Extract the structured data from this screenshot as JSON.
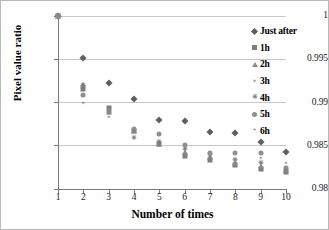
{
  "chart_data": {
    "type": "scatter",
    "title": "",
    "xlabel": "Number of times",
    "ylabel": "Pixel value ratio",
    "xlim": [
      1,
      10
    ],
    "ylim": [
      0.98,
      1
    ],
    "grid": true,
    "legend_position": "right",
    "x_ticks": [
      "1",
      "2",
      "3",
      "4",
      "5",
      "6",
      "7",
      "8",
      "9",
      "10"
    ],
    "y_ticks": [
      "0.98",
      "0.985",
      "0.99",
      "0.995",
      "1"
    ],
    "x": [
      1,
      2,
      3,
      4,
      5,
      6,
      7,
      8,
      9,
      10
    ],
    "series": [
      {
        "name": "Just after",
        "marker": "diamond",
        "color": "#5f5f5f",
        "values": [
          1.0,
          0.9951,
          0.99225,
          0.99035,
          0.98795,
          0.98785,
          0.98655,
          0.98645,
          0.98545,
          0.98425
        ]
      },
      {
        "name": "1h",
        "marker": "square",
        "color": "#7d7d7d",
        "values": [
          1.0,
          0.99155,
          0.98935,
          0.98665,
          0.98515,
          0.98385,
          0.98335,
          0.98275,
          0.98235,
          0.98195
        ]
      },
      {
        "name": "2h",
        "marker": "triangle",
        "color": "#8a8a8a",
        "values": [
          1.0,
          0.99215,
          0.98895,
          0.98675,
          0.98525,
          0.98425,
          0.98365,
          0.98305,
          0.98265,
          0.98215
        ]
      },
      {
        "name": "3h",
        "marker": "cross",
        "color": "#7a7a7a",
        "values": [
          1.0,
          0.98995,
          0.98835,
          0.98665,
          0.98525,
          0.98495,
          0.98375,
          0.98335,
          0.98355,
          0.98305
        ]
      },
      {
        "name": "4h",
        "marker": "star",
        "color": "#7a7a7a",
        "values": [
          1.0,
          0.99185,
          0.98875,
          0.98595,
          0.98545,
          0.98465,
          0.98395,
          0.98335,
          0.98295,
          0.98235
        ]
      },
      {
        "name": "5h",
        "marker": "circle",
        "color": "#8f8f8f",
        "values": [
          1.0,
          0.99085,
          0.98905,
          0.98695,
          0.98635,
          0.98505,
          0.98415,
          0.98415,
          0.98415,
          0.98245
        ]
      },
      {
        "name": "6h",
        "marker": "plus",
        "color": "#7a7a7a",
        "values": [
          1.0,
          0.99175,
          0.98885,
          0.98675,
          0.98495,
          0.98455,
          0.98345,
          0.98295,
          0.98285,
          0.98225
        ]
      }
    ]
  },
  "legend": {
    "items": [
      {
        "label": "Just after",
        "marker": "diamond"
      },
      {
        "label": "1h",
        "marker": "square"
      },
      {
        "label": "2h",
        "marker": "triangle"
      },
      {
        "label": "3h",
        "marker": "cross"
      },
      {
        "label": "4h",
        "marker": "star"
      },
      {
        "label": "5h",
        "marker": "circle"
      },
      {
        "label": "6h",
        "marker": "plus"
      }
    ]
  },
  "glyphs": {
    "cross": "×",
    "star": "✳",
    "plus": "+"
  }
}
